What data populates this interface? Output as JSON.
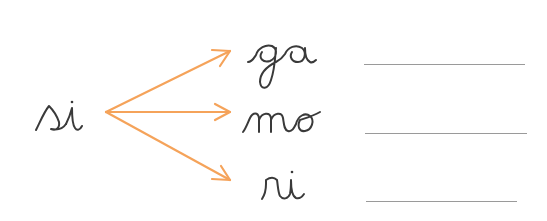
{
  "exercise": {
    "source_syllable": "si",
    "targets": [
      {
        "syllable": "ga",
        "answer": ""
      },
      {
        "syllable": "mo",
        "answer": ""
      },
      {
        "syllable": "ri",
        "answer": ""
      }
    ]
  },
  "colors": {
    "arrow": "#f5a35a",
    "ink": "#3a3a3a",
    "answer_line": "#9a9a9a",
    "background": "#ffffff"
  },
  "icons": {
    "arrow": "arrow-right-icon"
  }
}
